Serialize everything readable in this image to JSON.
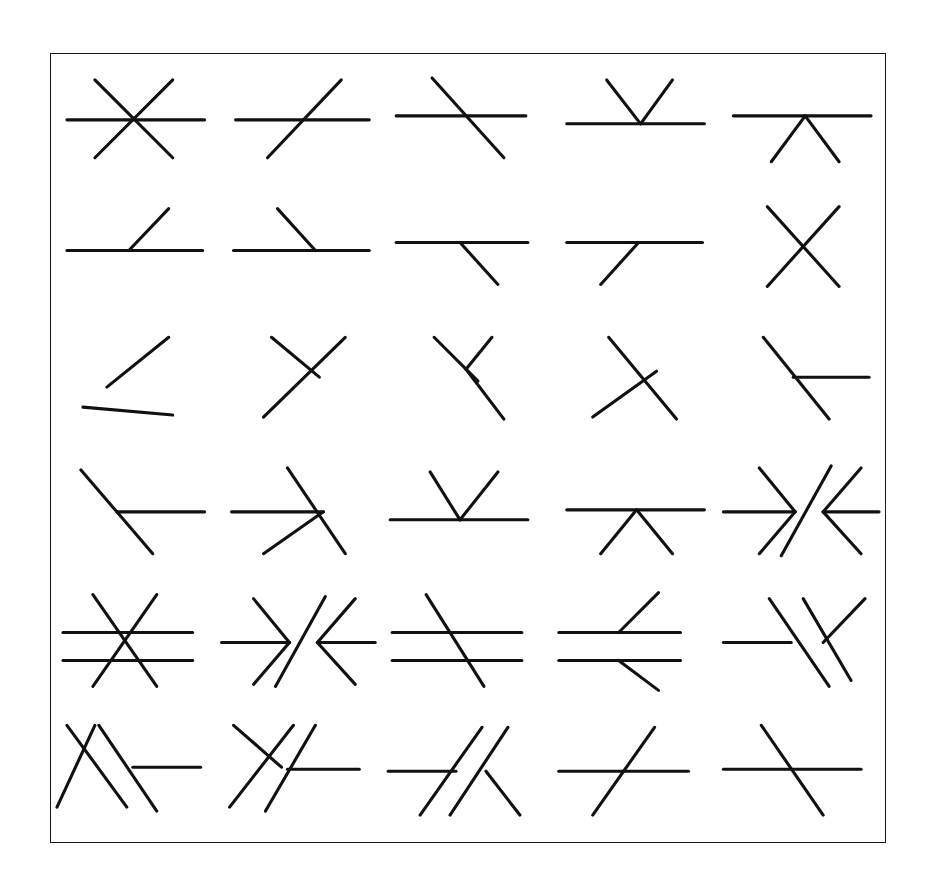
{
  "figure": {
    "type": "line-drawing-stimulus-array",
    "title": "",
    "background_color": "#ffffff",
    "stroke_color": "#111111",
    "border_color": "#1a1a1a",
    "stroke_width": 3.1,
    "border_width": 1.6,
    "frame": {
      "x": 50,
      "y": 53,
      "width": 836,
      "height": 790
    },
    "grid": {
      "rows": 6,
      "columns": 5,
      "cell_width": 167,
      "cell_height": 131
    },
    "cell_count": 30
  },
  "chart_data": {
    "type": "table",
    "rows": 6,
    "columns": 5,
    "cells": [
      {
        "row": 1,
        "col": 1,
        "name": "asterisk-cross",
        "segments": [
          {
            "x1": 14,
            "y1": 62,
            "x2": 152,
            "y2": 62
          },
          {
            "x1": 42,
            "y1": 22,
            "x2": 120,
            "y2": 100
          },
          {
            "x1": 120,
            "y1": 22,
            "x2": 42,
            "y2": 100
          }
        ]
      },
      {
        "row": 1,
        "col": 2,
        "name": "horizontal-with-rising-diagonal",
        "segments": [
          {
            "x1": 16,
            "y1": 62,
            "x2": 150,
            "y2": 62
          },
          {
            "x1": 48,
            "y1": 100,
            "x2": 122,
            "y2": 22
          }
        ]
      },
      {
        "row": 1,
        "col": 3,
        "name": "horizontal-with-falling-diagonal",
        "segments": [
          {
            "x1": 10,
            "y1": 58,
            "x2": 140,
            "y2": 58
          },
          {
            "x1": 46,
            "y1": 20,
            "x2": 118,
            "y2": 100
          }
        ]
      },
      {
        "row": 1,
        "col": 4,
        "name": "horizontal-with-upward-vee",
        "segments": [
          {
            "x1": 14,
            "y1": 66,
            "x2": 152,
            "y2": 66
          },
          {
            "x1": 54,
            "y1": 22,
            "x2": 88,
            "y2": 66
          },
          {
            "x1": 88,
            "y1": 66,
            "x2": 120,
            "y2": 22
          }
        ]
      },
      {
        "row": 1,
        "col": 5,
        "name": "horizontal-with-downward-vee",
        "segments": [
          {
            "x1": 14,
            "y1": 58,
            "x2": 152,
            "y2": 58
          },
          {
            "x1": 52,
            "y1": 104,
            "x2": 86,
            "y2": 58
          },
          {
            "x1": 86,
            "y1": 58,
            "x2": 120,
            "y2": 104
          }
        ]
      },
      {
        "row": 2,
        "col": 1,
        "name": "horizontal-with-short-rising-spur",
        "segments": [
          {
            "x1": 14,
            "y1": 62,
            "x2": 150,
            "y2": 62
          },
          {
            "x1": 76,
            "y1": 62,
            "x2": 116,
            "y2": 20
          }
        ]
      },
      {
        "row": 2,
        "col": 2,
        "name": "horizontal-with-short-falling-spur",
        "segments": [
          {
            "x1": 14,
            "y1": 62,
            "x2": 150,
            "y2": 62
          },
          {
            "x1": 58,
            "y1": 20,
            "x2": 96,
            "y2": 62
          }
        ]
      },
      {
        "row": 2,
        "col": 3,
        "name": "horizontal-with-spur-below-right",
        "segments": [
          {
            "x1": 10,
            "y1": 54,
            "x2": 142,
            "y2": 54
          },
          {
            "x1": 74,
            "y1": 54,
            "x2": 112,
            "y2": 96
          }
        ]
      },
      {
        "row": 2,
        "col": 4,
        "name": "horizontal-with-spur-below-left",
        "segments": [
          {
            "x1": 14,
            "y1": 54,
            "x2": 150,
            "y2": 54
          },
          {
            "x1": 86,
            "y1": 54,
            "x2": 48,
            "y2": 96
          }
        ]
      },
      {
        "row": 2,
        "col": 5,
        "name": "x-crossing",
        "segments": [
          {
            "x1": 48,
            "y1": 18,
            "x2": 120,
            "y2": 98
          },
          {
            "x1": 120,
            "y1": 18,
            "x2": 48,
            "y2": 98
          }
        ]
      },
      {
        "row": 3,
        "col": 1,
        "name": "left-pointing-vee-with-tail",
        "segments": [
          {
            "x1": 116,
            "y1": 18,
            "x2": 54,
            "y2": 68
          },
          {
            "x1": 30,
            "y1": 88,
            "x2": 120,
            "y2": 96
          }
        ]
      },
      {
        "row": 3,
        "col": 2,
        "name": "y-junction-right",
        "segments": [
          {
            "x1": 52,
            "y1": 18,
            "x2": 100,
            "y2": 58
          },
          {
            "x1": 126,
            "y1": 18,
            "x2": 44,
            "y2": 98
          }
        ]
      },
      {
        "row": 3,
        "col": 3,
        "name": "narrow-vee-with-stem",
        "segments": [
          {
            "x1": 48,
            "y1": 18,
            "x2": 92,
            "y2": 62
          },
          {
            "x1": 106,
            "y1": 18,
            "x2": 80,
            "y2": 50
          },
          {
            "x1": 80,
            "y1": 50,
            "x2": 118,
            "y2": 100
          }
        ]
      },
      {
        "row": 3,
        "col": 4,
        "name": "crossed-diagonals-right-lean",
        "segments": [
          {
            "x1": 56,
            "y1": 18,
            "x2": 124,
            "y2": 100
          },
          {
            "x1": 40,
            "y1": 98,
            "x2": 104,
            "y2": 52
          }
        ]
      },
      {
        "row": 3,
        "col": 5,
        "name": "diagonal-with-horizontal-branch",
        "segments": [
          {
            "x1": 44,
            "y1": 18,
            "x2": 110,
            "y2": 100
          },
          {
            "x1": 74,
            "y1": 58,
            "x2": 150,
            "y2": 58
          }
        ]
      },
      {
        "row": 4,
        "col": 1,
        "name": "left-arrowhead-with-shaft",
        "segments": [
          {
            "x1": 152,
            "y1": 62,
            "x2": 64,
            "y2": 62
          },
          {
            "x1": 28,
            "y1": 20,
            "x2": 64,
            "y2": 62
          },
          {
            "x1": 64,
            "y1": 62,
            "x2": 100,
            "y2": 104
          }
        ]
      },
      {
        "row": 4,
        "col": 2,
        "name": "right-arrowhead-with-shaft",
        "segments": [
          {
            "x1": 12,
            "y1": 62,
            "x2": 104,
            "y2": 62
          },
          {
            "x1": 68,
            "y1": 18,
            "x2": 126,
            "y2": 104
          },
          {
            "x1": 44,
            "y1": 104,
            "x2": 104,
            "y2": 62
          }
        ]
      },
      {
        "row": 4,
        "col": 3,
        "name": "horizontal-with-upward-vee-wide",
        "segments": [
          {
            "x1": 4,
            "y1": 70,
            "x2": 142,
            "y2": 70
          },
          {
            "x1": 44,
            "y1": 22,
            "x2": 74,
            "y2": 70
          },
          {
            "x1": 74,
            "y1": 70,
            "x2": 112,
            "y2": 22
          }
        ]
      },
      {
        "row": 4,
        "col": 4,
        "name": "horizontal-with-downward-vee-wide",
        "segments": [
          {
            "x1": 14,
            "y1": 60,
            "x2": 152,
            "y2": 60
          },
          {
            "x1": 48,
            "y1": 104,
            "x2": 84,
            "y2": 60
          },
          {
            "x1": 84,
            "y1": 60,
            "x2": 120,
            "y2": 104
          }
        ]
      },
      {
        "row": 4,
        "col": 5,
        "name": "double-arrowhead-with-long-diagonal",
        "segments": [
          {
            "x1": 4,
            "y1": 62,
            "x2": 76,
            "y2": 62
          },
          {
            "x1": 40,
            "y1": 18,
            "x2": 76,
            "y2": 62
          },
          {
            "x1": 76,
            "y1": 62,
            "x2": 40,
            "y2": 104
          },
          {
            "x1": 160,
            "y1": 62,
            "x2": 104,
            "y2": 62
          },
          {
            "x1": 142,
            "y1": 18,
            "x2": 104,
            "y2": 62
          },
          {
            "x1": 104,
            "y1": 62,
            "x2": 142,
            "y2": 104
          },
          {
            "x1": 112,
            "y1": 16,
            "x2": 62,
            "y2": 106
          }
        ]
      },
      {
        "row": 5,
        "col": 1,
        "name": "double-horizontal-with-asterisk",
        "segments": [
          {
            "x1": 10,
            "y1": 52,
            "x2": 140,
            "y2": 52
          },
          {
            "x1": 10,
            "y1": 80,
            "x2": 140,
            "y2": 80
          },
          {
            "x1": 40,
            "y1": 14,
            "x2": 104,
            "y2": 106
          },
          {
            "x1": 104,
            "y1": 14,
            "x2": 40,
            "y2": 106
          }
        ]
      },
      {
        "row": 5,
        "col": 2,
        "name": "double-arrowhead-with-long-diagonal-b",
        "segments": [
          {
            "x1": 2,
            "y1": 62,
            "x2": 70,
            "y2": 62
          },
          {
            "x1": 34,
            "y1": 18,
            "x2": 70,
            "y2": 62
          },
          {
            "x1": 70,
            "y1": 62,
            "x2": 34,
            "y2": 104
          },
          {
            "x1": 156,
            "y1": 62,
            "x2": 98,
            "y2": 62
          },
          {
            "x1": 136,
            "y1": 18,
            "x2": 98,
            "y2": 62
          },
          {
            "x1": 98,
            "y1": 62,
            "x2": 136,
            "y2": 104
          },
          {
            "x1": 106,
            "y1": 16,
            "x2": 56,
            "y2": 106
          }
        ]
      },
      {
        "row": 5,
        "col": 3,
        "name": "double-horizontal-with-crossing-diagonal",
        "segments": [
          {
            "x1": 6,
            "y1": 52,
            "x2": 136,
            "y2": 52
          },
          {
            "x1": 6,
            "y1": 80,
            "x2": 136,
            "y2": 80
          },
          {
            "x1": 40,
            "y1": 14,
            "x2": 98,
            "y2": 106
          }
        ]
      },
      {
        "row": 5,
        "col": 4,
        "name": "double-horizontal-with-vee-spurs",
        "segments": [
          {
            "x1": 6,
            "y1": 52,
            "x2": 128,
            "y2": 52
          },
          {
            "x1": 6,
            "y1": 80,
            "x2": 128,
            "y2": 80
          },
          {
            "x1": 66,
            "y1": 52,
            "x2": 106,
            "y2": 12
          },
          {
            "x1": 66,
            "y1": 80,
            "x2": 106,
            "y2": 110
          }
        ]
      },
      {
        "row": 5,
        "col": 5,
        "name": "horizontal-stub-with-parallel-diagonals",
        "segments": [
          {
            "x1": 4,
            "y1": 62,
            "x2": 72,
            "y2": 62
          },
          {
            "x1": 50,
            "y1": 18,
            "x2": 110,
            "y2": 106
          },
          {
            "x1": 84,
            "y1": 18,
            "x2": 132,
            "y2": 100
          },
          {
            "x1": 146,
            "y1": 18,
            "x2": 104,
            "y2": 62
          }
        ]
      },
      {
        "row": 6,
        "col": 1,
        "name": "x-cross-with-parallel-diagonal-and-stub",
        "segments": [
          {
            "x1": 14,
            "y1": 14,
            "x2": 74,
            "y2": 96
          },
          {
            "x1": 42,
            "y1": 14,
            "x2": 4,
            "y2": 96
          },
          {
            "x1": 46,
            "y1": 14,
            "x2": 104,
            "y2": 100
          },
          {
            "x1": 80,
            "y1": 56,
            "x2": 148,
            "y2": 56
          }
        ]
      },
      {
        "row": 6,
        "col": 2,
        "name": "y-junction-with-parallel-diagonal-and-stub",
        "segments": [
          {
            "x1": 14,
            "y1": 14,
            "x2": 62,
            "y2": 56
          },
          {
            "x1": 74,
            "y1": 14,
            "x2": 10,
            "y2": 96
          },
          {
            "x1": 96,
            "y1": 14,
            "x2": 46,
            "y2": 100
          },
          {
            "x1": 68,
            "y1": 58,
            "x2": 140,
            "y2": 58
          }
        ]
      },
      {
        "row": 6,
        "col": 3,
        "name": "horizontal-stub-with-crossing-and-vee",
        "segments": [
          {
            "x1": 2,
            "y1": 60,
            "x2": 70,
            "y2": 60
          },
          {
            "x1": 96,
            "y1": 16,
            "x2": 34,
            "y2": 104
          },
          {
            "x1": 122,
            "y1": 16,
            "x2": 64,
            "y2": 104
          },
          {
            "x1": 100,
            "y1": 60,
            "x2": 134,
            "y2": 104
          }
        ]
      },
      {
        "row": 6,
        "col": 4,
        "name": "horizontal-with-rising-diagonal-b",
        "segments": [
          {
            "x1": 6,
            "y1": 60,
            "x2": 136,
            "y2": 60
          },
          {
            "x1": 40,
            "y1": 104,
            "x2": 102,
            "y2": 16
          }
        ]
      },
      {
        "row": 6,
        "col": 5,
        "name": "horizontal-with-falling-diagonal-b",
        "segments": [
          {
            "x1": 4,
            "y1": 58,
            "x2": 142,
            "y2": 58
          },
          {
            "x1": 42,
            "y1": 14,
            "x2": 104,
            "y2": 104
          }
        ]
      }
    ]
  }
}
